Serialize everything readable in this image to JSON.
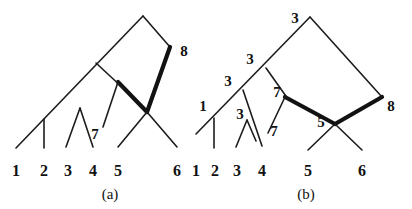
{
  "figure": {
    "caption_a": "(a)",
    "caption_b": "(b)",
    "line_color": "#1c1c1c",
    "bold_color": "#121212",
    "background": "#ffffff"
  },
  "panel_a": {
    "caption": "(a)",
    "leaf_labels": [
      "1",
      "2",
      "3",
      "4",
      "5",
      "6"
    ],
    "internal_labels": [
      "7",
      "8"
    ],
    "label_7": "7",
    "label_8": "8"
  },
  "panel_b": {
    "caption": "(b)",
    "leaf_labels": [
      "1",
      "2",
      "3",
      "4",
      "5",
      "6"
    ],
    "internal_labels": [
      "3",
      "3",
      "3",
      "1",
      "3",
      "7",
      "7",
      "5",
      "8"
    ],
    "label_top_3": "3",
    "label_mid_3": "3",
    "label_low_3": "3",
    "label_1": "1",
    "label_inner_3": "3",
    "label_7_upper": "7",
    "label_7_lower": "7",
    "label_5": "5",
    "label_8": "8"
  }
}
